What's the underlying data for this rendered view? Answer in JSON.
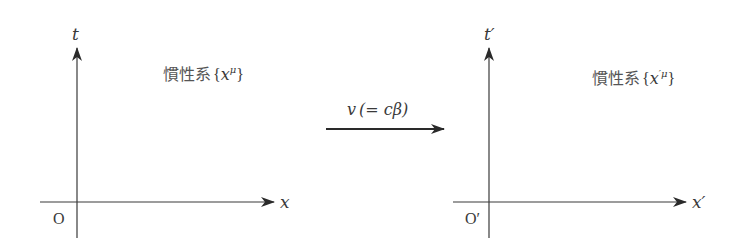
{
  "diagram": {
    "colors": {
      "axis": "#3a3a3a",
      "text": "#3a3a3a",
      "label": "#555555"
    },
    "left_frame": {
      "time_axis_label": "t",
      "space_axis_label": "x",
      "origin_label": "O",
      "frame_label_prefix": "慣性系",
      "frame_label_open": "{",
      "frame_label_var": "x",
      "frame_label_sup": "μ",
      "frame_label_close": "}"
    },
    "velocity_arrow": {
      "label_v": "v",
      "label_paren": "(= cβ)"
    },
    "right_frame": {
      "time_axis_label": "t′",
      "space_axis_label": "x′",
      "origin_label": "O′",
      "frame_label_prefix": "慣性系",
      "frame_label_open": "{",
      "frame_label_var": "x",
      "frame_label_sup": "′μ",
      "frame_label_close": "}"
    }
  }
}
